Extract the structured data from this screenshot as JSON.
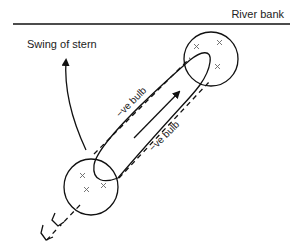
{
  "diagram": {
    "labels": {
      "river_bank": "River bank",
      "swing_of_stern": "Swing of stern",
      "neg_bulb_upper": "−ve bulb",
      "neg_bulb_lower": "−ve bulb"
    },
    "elements": {
      "river_bank_line": "river-bank-line",
      "bow_circle": "bow-circle",
      "stern_circle": "stern-circle",
      "ship_hull_outline": "ship-hull-outline",
      "pressure_field_outline": "dashed-pressure-field",
      "direction_arrow": "direction-of-motion-arrow",
      "stern_swing_arrow": "stern-swing-arrow",
      "wake": "propeller-wake"
    },
    "colors": {
      "line": "#111111",
      "cross_marks": "#666666",
      "background": "#ffffff"
    }
  }
}
